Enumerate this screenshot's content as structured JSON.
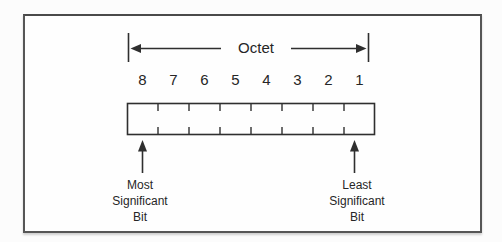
{
  "diagram": {
    "octet_label": "Octet",
    "bit_numbers": [
      "8",
      "7",
      "6",
      "5",
      "4",
      "3",
      "2",
      "1"
    ],
    "cell_count": 8,
    "msb_label": "Most\nSignificant\nBit",
    "lsb_label": "Least\nSignificant\nBit",
    "colors": {
      "ink": "#262626",
      "line": "#2f2f2f",
      "frame_border": "#565656",
      "background": "#fcfcfc"
    }
  }
}
